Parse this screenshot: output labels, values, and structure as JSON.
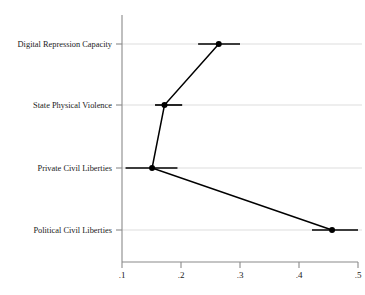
{
  "chart_data": {
    "type": "scatter",
    "title": "",
    "subtitle": "",
    "xlabel": "",
    "ylabel": "",
    "orientation": "horizontal",
    "grid": true,
    "legend": null,
    "xlim": [
      0.1,
      0.5
    ],
    "xticks": [
      0.1,
      0.2,
      0.3,
      0.4,
      0.5
    ],
    "xticklabels": [
      ".1",
      ".2",
      ".3",
      ".4",
      ".5"
    ],
    "categories": [
      "Digital Repression Capacity",
      "State Physical Violence",
      "Private Civil Liberties",
      "Political Civil Liberties"
    ],
    "series": [
      {
        "name": "Estimate",
        "marker": "circle",
        "values": [
          0.264,
          0.172,
          0.151,
          0.456
        ],
        "ci_low": [
          0.229,
          0.156,
          0.106,
          0.422
        ],
        "ci_high": [
          0.3,
          0.202,
          0.194,
          0.5
        ]
      }
    ],
    "annotations": []
  },
  "axis": {
    "x_tick_labels": [
      ".1",
      ".2",
      ".3",
      ".4",
      ".5"
    ],
    "y_category_labels": [
      "Digital Repression Capacity",
      "State Physical Violence",
      "Private Civil Liberties",
      "Political Civil Liberties"
    ]
  },
  "colors": {
    "marker": "#000000",
    "connector": "#000000",
    "ci": "#000000",
    "grid": "#cfcfcf",
    "axis": "#8a8a8a",
    "background": "#ffffff",
    "text": "#1a1a1a"
  },
  "caption": {
    "text": ""
  }
}
